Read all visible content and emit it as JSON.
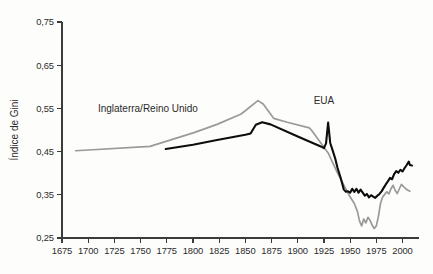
{
  "chart_data": {
    "type": "line",
    "title": "",
    "subtitle": "",
    "xlabel": "",
    "ylabel": "Índice de Gini",
    "xlim": [
      1675,
      2010
    ],
    "ylim": [
      0.25,
      0.75
    ],
    "grid": false,
    "legend_position": "inline-annotations",
    "x_ticks": [
      "1675",
      "1700",
      "1725",
      "1750",
      "1775",
      "1800",
      "1825",
      "1850",
      "1875",
      "1900",
      "1925",
      "1950",
      "1975",
      "2000"
    ],
    "x_tick_values": [
      1675,
      1700,
      1725,
      1750,
      1775,
      1800,
      1825,
      1850,
      1875,
      1900,
      1925,
      1950,
      1975,
      2000
    ],
    "y_ticks": [
      "0,25",
      "0,35",
      "0,45",
      "0,55",
      "0,65",
      "0,75"
    ],
    "y_tick_values": [
      0.25,
      0.35,
      0.45,
      0.55,
      0.65,
      0.75
    ],
    "series": [
      {
        "name": "Inglaterra/Reino Unido",
        "color": "#9a9a9a",
        "label_x": 1757,
        "label_y": 0.542,
        "points": [
          [
            1688,
            0.452
          ],
          [
            1759,
            0.462
          ],
          [
            1801,
            0.494
          ],
          [
            1823,
            0.513
          ],
          [
            1846,
            0.537
          ],
          [
            1862,
            0.568
          ],
          [
            1867,
            0.56
          ],
          [
            1877,
            0.527
          ],
          [
            1890,
            0.518
          ],
          [
            1911,
            0.505
          ],
          [
            1913,
            0.5
          ],
          [
            1929,
            0.447
          ],
          [
            1938,
            0.4
          ],
          [
            1949,
            0.349
          ],
          [
            1954,
            0.33
          ],
          [
            1957,
            0.311
          ],
          [
            1959,
            0.289
          ],
          [
            1961,
            0.278
          ],
          [
            1963,
            0.294
          ],
          [
            1965,
            0.285
          ],
          [
            1967,
            0.298
          ],
          [
            1969,
            0.291
          ],
          [
            1971,
            0.28
          ],
          [
            1973,
            0.272
          ],
          [
            1975,
            0.278
          ],
          [
            1977,
            0.3
          ],
          [
            1979,
            0.33
          ],
          [
            1981,
            0.345
          ],
          [
            1983,
            0.351
          ],
          [
            1985,
            0.357
          ],
          [
            1987,
            0.352
          ],
          [
            1989,
            0.364
          ],
          [
            1991,
            0.372
          ],
          [
            1993,
            0.36
          ],
          [
            1995,
            0.353
          ],
          [
            1997,
            0.364
          ],
          [
            1999,
            0.374
          ],
          [
            2001,
            0.369
          ],
          [
            2004,
            0.362
          ],
          [
            2007,
            0.358
          ]
        ]
      },
      {
        "name": "EUA",
        "color": "#0d0d0d",
        "label_x": 1925,
        "label_y": 0.56,
        "points": [
          [
            1774,
            0.456
          ],
          [
            1800,
            0.466
          ],
          [
            1823,
            0.477
          ],
          [
            1850,
            0.489
          ],
          [
            1855,
            0.492
          ],
          [
            1860,
            0.512
          ],
          [
            1866,
            0.518
          ],
          [
            1874,
            0.513
          ],
          [
            1900,
            0.485
          ],
          [
            1922,
            0.462
          ],
          [
            1925,
            0.458
          ],
          [
            1927,
            0.469
          ],
          [
            1929,
            0.517
          ],
          [
            1931,
            0.47
          ],
          [
            1933,
            0.455
          ],
          [
            1936,
            0.432
          ],
          [
            1938,
            0.412
          ],
          [
            1941,
            0.389
          ],
          [
            1944,
            0.362
          ],
          [
            1946,
            0.357
          ],
          [
            1948,
            0.358
          ],
          [
            1950,
            0.355
          ],
          [
            1952,
            0.364
          ],
          [
            1954,
            0.357
          ],
          [
            1956,
            0.364
          ],
          [
            1958,
            0.355
          ],
          [
            1960,
            0.362
          ],
          [
            1962,
            0.355
          ],
          [
            1964,
            0.348
          ],
          [
            1966,
            0.352
          ],
          [
            1968,
            0.344
          ],
          [
            1970,
            0.349
          ],
          [
            1972,
            0.346
          ],
          [
            1974,
            0.343
          ],
          [
            1976,
            0.348
          ],
          [
            1978,
            0.352
          ],
          [
            1980,
            0.358
          ],
          [
            1982,
            0.366
          ],
          [
            1984,
            0.374
          ],
          [
            1986,
            0.381
          ],
          [
            1988,
            0.389
          ],
          [
            1990,
            0.386
          ],
          [
            1992,
            0.398
          ],
          [
            1994,
            0.405
          ],
          [
            1996,
            0.401
          ],
          [
            1998,
            0.408
          ],
          [
            2000,
            0.404
          ],
          [
            2002,
            0.412
          ],
          [
            2004,
            0.419
          ],
          [
            2006,
            0.427
          ],
          [
            2007,
            0.419
          ],
          [
            2009,
            0.418
          ]
        ]
      }
    ]
  }
}
